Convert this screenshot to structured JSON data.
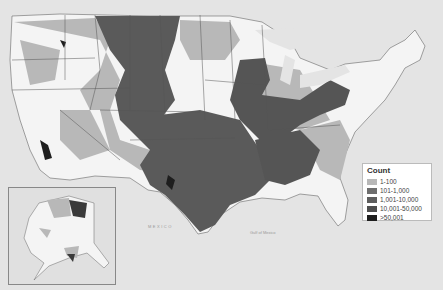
{
  "map": {
    "type": "choropleth",
    "region": "United States (contiguous + Alaska inset)",
    "colors": {
      "water": "#e4e4e4",
      "land_none": "#f8f8f8",
      "c1": "#b8b8b8",
      "c2": "#6e6e6e",
      "c3": "#5e5e5e",
      "c4": "#4e4e4e",
      "c5": "#1e1e1e",
      "border": "#555555"
    }
  },
  "legend": {
    "title": "Count",
    "items": [
      {
        "label": "1-100",
        "color": "#b8b8b8"
      },
      {
        "label": "101-1,000",
        "color": "#6e6e6e"
      },
      {
        "label": "1,001-10,000",
        "color": "#5e5e5e"
      },
      {
        "label": "10,001-50,000",
        "color": "#4e4e4e"
      },
      {
        "label": ">50,001",
        "color": "#1e1e1e"
      }
    ]
  },
  "labels": {
    "mexico": "MEXICO",
    "gulf": "Gulf of Mexico"
  }
}
